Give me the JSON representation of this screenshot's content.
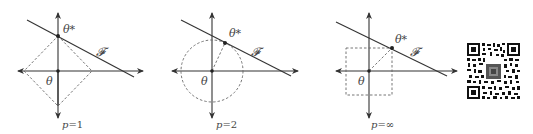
{
  "figure": {
    "panels": [
      {
        "id": "p1",
        "caption": "p = 1",
        "caption_var": "p",
        "caption_eq": "=",
        "caption_val": "1",
        "ball_shape": "diamond",
        "labels": {
          "optimum": "θ*",
          "feasible_set": "𝓕",
          "origin": "θ"
        }
      },
      {
        "id": "p2",
        "caption": "p = 2",
        "caption_var": "p",
        "caption_eq": "=",
        "caption_val": "2",
        "ball_shape": "circle",
        "labels": {
          "optimum": "θ*",
          "feasible_set": "𝓕",
          "origin": "θ"
        }
      },
      {
        "id": "pinf",
        "caption": "p = ∞",
        "caption_var": "p",
        "caption_eq": "=",
        "caption_val": "∞",
        "ball_shape": "square",
        "labels": {
          "optimum": "θ*",
          "feasible_set": "𝓕",
          "origin": "θ"
        }
      }
    ],
    "qr_code": {
      "description": "QR code"
    },
    "colors": {
      "axis": "#333333",
      "line": "#333333",
      "dashed": "#666666",
      "text": "#444444",
      "background": "#ffffff"
    }
  }
}
